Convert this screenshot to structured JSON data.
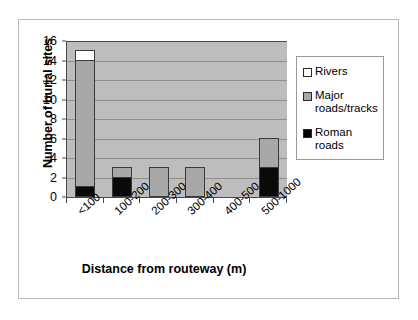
{
  "chart_data": {
    "type": "bar",
    "stacked": true,
    "title": "",
    "xlabel": "Distance from routeway (m)",
    "ylabel": "Number of burial sites",
    "categories": [
      "<100",
      "100-200",
      "200-300",
      "300-400",
      "400-500",
      "500-1000"
    ],
    "series": [
      {
        "name": "Roman roads",
        "color": "#000000",
        "values": [
          1,
          2,
          0,
          0,
          0,
          3
        ]
      },
      {
        "name": "Major roads/tracks",
        "color": "#a8a8a8",
        "values": [
          13,
          1,
          3,
          3,
          0,
          3
        ]
      },
      {
        "name": "Rivers",
        "color": "#ffffff",
        "values": [
          1,
          0,
          0,
          0,
          0,
          0
        ]
      }
    ],
    "totals": [
      15,
      3,
      3,
      3,
      0,
      6
    ],
    "ylim": [
      0,
      16
    ],
    "yticks": [
      0,
      2,
      4,
      6,
      8,
      10,
      12,
      14,
      16
    ],
    "ytick_labels": [
      "0",
      "2",
      "4",
      "6",
      "8",
      "10",
      "12",
      "14",
      "16"
    ],
    "grid": "horizontal",
    "plot_background": "#bdbdbd",
    "legend_position": "right",
    "legend_entries": [
      {
        "label": "Rivers",
        "swatch": "#ffffff"
      },
      {
        "label": "Major roads/tracks",
        "swatch": "#a8a8a8"
      },
      {
        "label": "Roman roads",
        "swatch": "#000000"
      }
    ]
  }
}
